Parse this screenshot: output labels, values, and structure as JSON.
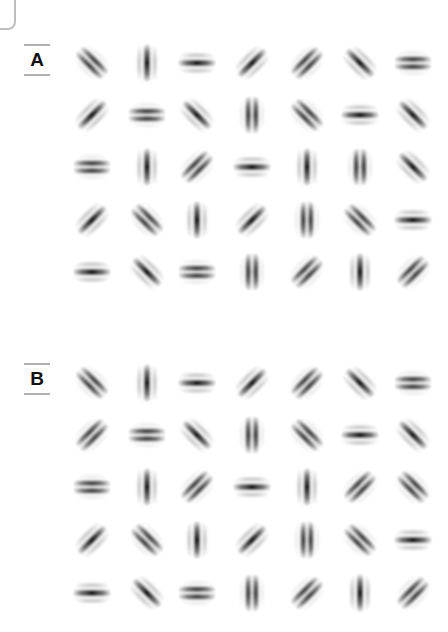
{
  "panels": [
    {
      "label": "A",
      "label_top": 44,
      "row_y": [
        63,
        115,
        167,
        220,
        272
      ],
      "rows": [
        [
          [
            "135",
            "odd"
          ],
          [
            "0",
            "even"
          ],
          [
            "90",
            "even"
          ],
          [
            "45",
            "even"
          ],
          [
            "45",
            "odd"
          ],
          [
            "135",
            "even"
          ],
          [
            "90",
            "odd"
          ]
        ],
        [
          [
            "45",
            "even"
          ],
          [
            "90",
            "odd"
          ],
          [
            "135",
            "even"
          ],
          [
            "0",
            "odd"
          ],
          [
            "135",
            "odd"
          ],
          [
            "90",
            "even"
          ],
          [
            "135",
            "even"
          ]
        ],
        [
          [
            "90",
            "odd"
          ],
          [
            "0",
            "even"
          ],
          [
            "45",
            "odd"
          ],
          [
            "90",
            "even"
          ],
          [
            "0",
            "even"
          ],
          [
            "0",
            "odd"
          ],
          [
            "135",
            "even"
          ]
        ],
        [
          [
            "45",
            "even"
          ],
          [
            "135",
            "odd"
          ],
          [
            "0",
            "even"
          ],
          [
            "45",
            "even"
          ],
          [
            "0",
            "odd"
          ],
          [
            "135",
            "odd"
          ],
          [
            "90",
            "even"
          ]
        ],
        [
          [
            "90",
            "even"
          ],
          [
            "135",
            "even"
          ],
          [
            "90",
            "odd"
          ],
          [
            "0",
            "odd"
          ],
          [
            "45",
            "odd"
          ],
          [
            "0",
            "even"
          ],
          [
            "45",
            "odd"
          ]
        ]
      ]
    },
    {
      "label": "B",
      "label_top": 363,
      "row_y": [
        383,
        435,
        487,
        540,
        593
      ],
      "rows": [
        [
          [
            "135",
            "odd"
          ],
          [
            "0",
            "even"
          ],
          [
            "90",
            "even"
          ],
          [
            "45",
            "even"
          ],
          [
            "45",
            "odd"
          ],
          [
            "135",
            "even"
          ],
          [
            "90",
            "odd"
          ]
        ],
        [
          [
            "45",
            "odd"
          ],
          [
            "90",
            "odd"
          ],
          [
            "135",
            "even"
          ],
          [
            "0",
            "odd"
          ],
          [
            "135",
            "odd"
          ],
          [
            "90",
            "even"
          ],
          [
            "135",
            "even"
          ]
        ],
        [
          [
            "90",
            "odd"
          ],
          [
            "0",
            "even"
          ],
          [
            "45",
            "odd"
          ],
          [
            "90",
            "even"
          ],
          [
            "0",
            "even"
          ],
          [
            "45",
            "odd"
          ],
          [
            "135",
            "odd"
          ]
        ],
        [
          [
            "45",
            "even"
          ],
          [
            "135",
            "odd"
          ],
          [
            "0",
            "even"
          ],
          [
            "45",
            "even"
          ],
          [
            "0",
            "odd"
          ],
          [
            "135",
            "odd"
          ],
          [
            "90",
            "even"
          ]
        ],
        [
          [
            "90",
            "even"
          ],
          [
            "135",
            "even"
          ],
          [
            "90",
            "odd"
          ],
          [
            "0",
            "odd"
          ],
          [
            "45",
            "odd"
          ],
          [
            "0",
            "even"
          ],
          [
            "45",
            "odd"
          ]
        ]
      ]
    }
  ],
  "col_x": [
    92,
    147,
    197,
    252,
    307,
    360,
    413
  ],
  "stimulus": "gabor-patch",
  "orientation_legend": {
    "0": "vertical",
    "45": "right-tilt",
    "90": "horizontal",
    "135": "left-tilt"
  },
  "colors": {
    "ink": "#111111",
    "background": "#ffffff",
    "rule": "#b0b0b0"
  }
}
